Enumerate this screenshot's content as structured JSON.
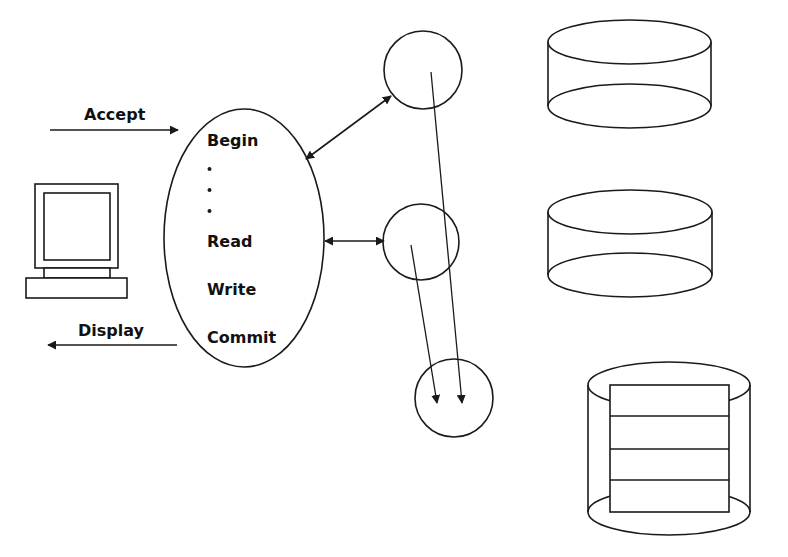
{
  "diagram": {
    "client": {
      "icon": "computer-terminal-icon",
      "input_label": "Accept",
      "output_label": "Display"
    },
    "transaction_program": {
      "shape": "ellipse",
      "steps": [
        "Begin",
        ".",
        ".",
        ".",
        "Read",
        "Write",
        "Commit"
      ]
    },
    "processes": [
      {
        "id": "process-1",
        "shape": "circle"
      },
      {
        "id": "process-2",
        "shape": "circle"
      },
      {
        "id": "process-3",
        "shape": "circle"
      }
    ],
    "storage": [
      {
        "id": "disk-1",
        "shape": "cylinder"
      },
      {
        "id": "disk-2",
        "shape": "cylinder"
      },
      {
        "id": "disk-3",
        "shape": "cylinder-with-records",
        "record_rows": 4
      }
    ],
    "connections": [
      {
        "from": "client",
        "to": "transaction_program",
        "label": "Accept",
        "direction": "right"
      },
      {
        "from": "transaction_program",
        "to": "client",
        "label": "Display",
        "direction": "left"
      },
      {
        "from": "transaction_program",
        "to": "process-1",
        "type": "bidirectional"
      },
      {
        "from": "transaction_program",
        "to": "process-2",
        "type": "bidirectional"
      },
      {
        "from": "process-1",
        "to": "process-3",
        "type": "directed"
      },
      {
        "from": "process-2",
        "to": "process-3",
        "type": "directed"
      }
    ],
    "colors": {
      "background": "#ffffff",
      "ink": "#1a1a1a"
    }
  }
}
